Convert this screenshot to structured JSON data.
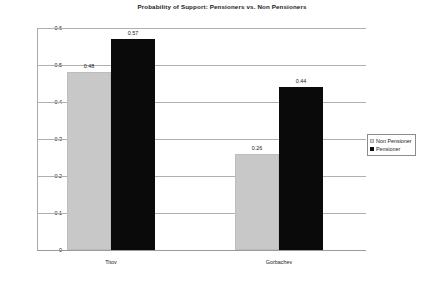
{
  "chart_data": {
    "type": "bar",
    "title": "Probability of Support: Pensioners vs. Non Pensioners",
    "xlabel": "",
    "ylabel": "",
    "categories": [
      "Titov",
      "Gorbachev"
    ],
    "series": [
      {
        "name": "Non Pensioner",
        "values": [
          0.48,
          0.26
        ],
        "color": "#c8c8c8"
      },
      {
        "name": "Pensioner",
        "values": [
          0.57,
          0.44
        ],
        "color": "#0a0a0a"
      }
    ],
    "value_labels": {
      "titov_non_pensioner": "0.48",
      "titov_pensioner": "0.57",
      "gorbachev_non_pensioner": "0.26",
      "gorbachev_pensioner": "0.44"
    },
    "ylim": [
      0,
      0.6
    ],
    "ytick_values": [
      0,
      0.1,
      0.2,
      0.3,
      0.4,
      0.5,
      0.6
    ],
    "ytick_labels": [
      "0",
      "0.1",
      "0.2",
      "0.3",
      "0.4",
      "0.5",
      "0.6"
    ],
    "grid": true,
    "grid_axis": "y",
    "legend_position": "right",
    "legend_entries": [
      "Non Pensioner",
      "Pensioner"
    ],
    "background_color": "#ffffff",
    "gridline_color": "#b0b0b0"
  }
}
